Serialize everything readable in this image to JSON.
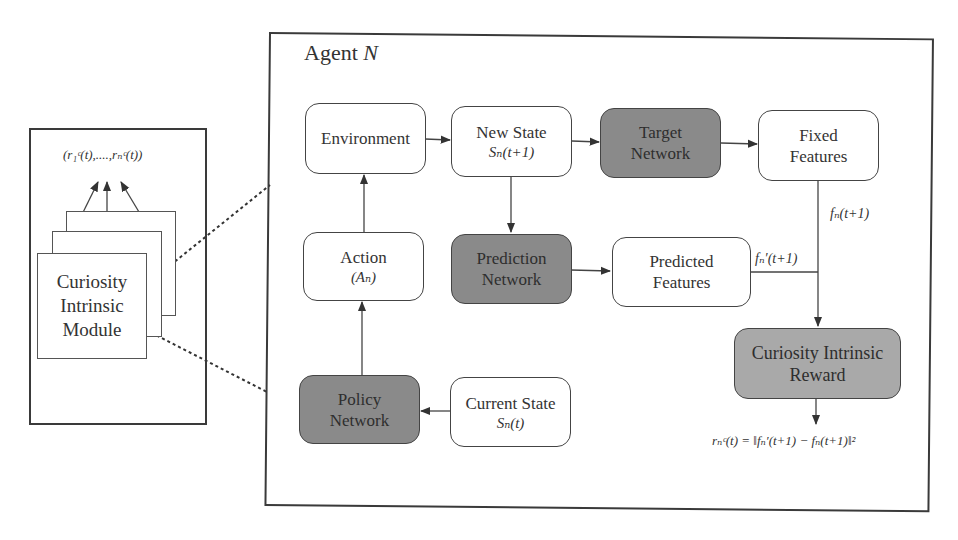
{
  "left_panel": {
    "output_label": "(r₁ᶜ(t),....,rₙᶜ(t))",
    "module_label_lines": [
      "Curiosity",
      "Intrinsic",
      "Module"
    ]
  },
  "agent": {
    "title_prefix": "Agent ",
    "title_var": "N",
    "nodes": {
      "environment": {
        "label": "Environment"
      },
      "new_state": {
        "label": "New State",
        "sub": "Sₙ(t+1)"
      },
      "target_network": {
        "label_lines": [
          "Target",
          "Network"
        ]
      },
      "fixed_features": {
        "label_lines": [
          "Fixed",
          "Features"
        ]
      },
      "action": {
        "label": "Action",
        "sub": "(Aₙ)"
      },
      "prediction_network": {
        "label_lines": [
          "Prediction",
          "Network"
        ]
      },
      "predicted_features": {
        "label_lines": [
          "Predicted",
          "Features"
        ]
      },
      "curiosity_reward": {
        "label_lines": [
          "Curiosity Intrinsic",
          "Reward"
        ]
      },
      "policy_network": {
        "label_lines": [
          "Policy",
          "Network"
        ]
      },
      "current_state": {
        "label": "Current State",
        "sub": "Sₙ(t)"
      }
    },
    "edge_labels": {
      "fixed_out": "fₙ(t+1)",
      "predicted_out": "fₙ′(t+1)",
      "reward_formula": "rₙᶜ(t) = ‖fₙ′(t+1) − fₙ(t+1)‖²"
    }
  },
  "colors": {
    "dark_node": "#8a8a8a",
    "mid_node": "#a9a9a9",
    "border": "#444444",
    "background": "#ffffff"
  }
}
